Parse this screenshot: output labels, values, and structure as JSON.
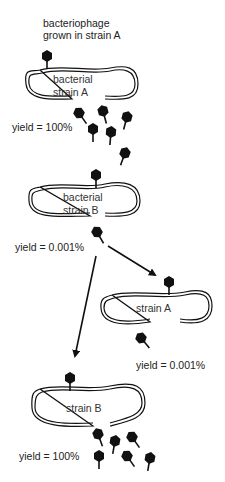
{
  "diagram": {
    "title": "bacteriophage grown in strain A",
    "title_lines": [
      "bacteriophage",
      "grown in strain A"
    ],
    "colors": {
      "ink": "#111111",
      "background": "#ffffff",
      "phage": "#1a1a1a",
      "phage_faded": "#333333"
    },
    "cells": [
      {
        "id": "cell-1",
        "lines": [
          "bacterial",
          "strain A"
        ],
        "yield": "yield = 100%"
      },
      {
        "id": "cell-2",
        "lines": [
          "bacterial",
          "strain B"
        ],
        "yield": "yield = 0.001%"
      },
      {
        "id": "cell-3",
        "lines": [
          "strain A"
        ],
        "yield": "yield = 0.001%"
      },
      {
        "id": "cell-4",
        "lines": [
          "strain B"
        ],
        "yield": "yield = 100%"
      }
    ],
    "arrows": [
      {
        "from": "cell-2",
        "to": "cell-3"
      },
      {
        "from": "cell-2",
        "to": "cell-4"
      }
    ]
  }
}
